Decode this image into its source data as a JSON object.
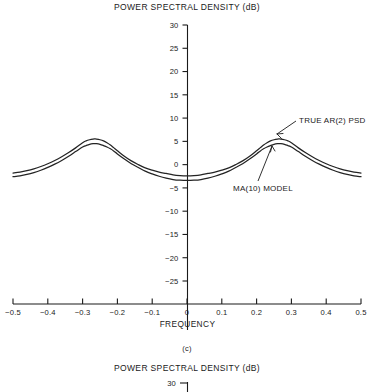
{
  "figure": {
    "panel_label": "(c)",
    "title": "POWER SPECTRAL DENSITY (dB)",
    "next_panel_title": "POWER SPECTRAL DENSITY (dB)",
    "next_panel_first_ytick": "30"
  },
  "chart_data": {
    "type": "line",
    "title": "POWER SPECTRAL DENSITY (dB)",
    "xlabel": "FREQUENCY",
    "ylabel": "POWER SPECTRAL DENSITY (dB)",
    "xlim": [
      -0.5,
      0.5
    ],
    "ylim": [
      -27.5,
      31
    ],
    "grid": false,
    "legend_position": "inline-annotations",
    "xticks": [
      -0.5,
      -0.4,
      -0.3,
      -0.2,
      -0.1,
      0,
      0.1,
      0.2,
      0.3,
      0.4,
      0.5
    ],
    "xticklabels": [
      "-0.5",
      "-0.4",
      "-0.3",
      "-0.2",
      "-0.1",
      "0",
      "0.1",
      "0.2",
      "0.3",
      "0.4",
      "0.5"
    ],
    "yticks": [
      30,
      25,
      20,
      15,
      10,
      5,
      0,
      -5,
      -10,
      -15,
      -20,
      -25
    ],
    "yticklabels": [
      "30",
      "25",
      "20",
      "15",
      "10",
      "5",
      "0",
      "-5",
      "-10",
      "-15",
      "-20",
      "-25"
    ],
    "annotations": [
      {
        "text": "TRUE AR(2) PSD",
        "points_to_series": "TRUE AR(2) PSD",
        "at_x": 0.245,
        "at_y": 5.4
      },
      {
        "text": "MA(10) MODEL",
        "points_to_series": "MA(10) MODEL",
        "at_x": 0.23,
        "at_y": 4.2
      }
    ],
    "x": [
      -0.5,
      -0.48,
      -0.46,
      -0.44,
      -0.42,
      -0.4,
      -0.38,
      -0.36,
      -0.34,
      -0.32,
      -0.3,
      -0.29,
      -0.28,
      -0.27,
      -0.265,
      -0.26,
      -0.25,
      -0.24,
      -0.23,
      -0.22,
      -0.21,
      -0.2,
      -0.18,
      -0.16,
      -0.14,
      -0.12,
      -0.1,
      -0.08,
      -0.06,
      -0.04,
      -0.02,
      0.0,
      0.02,
      0.04,
      0.06,
      0.08,
      0.1,
      0.12,
      0.14,
      0.16,
      0.18,
      0.2,
      0.21,
      0.22,
      0.23,
      0.24,
      0.25,
      0.26,
      0.265,
      0.27,
      0.28,
      0.29,
      0.3,
      0.32,
      0.34,
      0.36,
      0.38,
      0.4,
      0.42,
      0.44,
      0.46,
      0.48,
      0.5
    ],
    "series": [
      {
        "name": "TRUE AR(2) PSD",
        "values": [
          -1.8,
          -1.6,
          -1.3,
          -0.9,
          -0.4,
          0.2,
          0.9,
          1.7,
          2.6,
          3.6,
          4.7,
          5.1,
          5.35,
          5.5,
          5.52,
          5.5,
          5.35,
          5.1,
          4.7,
          4.2,
          3.6,
          3.0,
          1.8,
          0.8,
          0.0,
          -0.7,
          -1.2,
          -1.6,
          -1.9,
          -2.2,
          -2.35,
          -2.4,
          -2.35,
          -2.2,
          -1.9,
          -1.6,
          -1.2,
          -0.7,
          0.0,
          0.8,
          1.8,
          3.0,
          3.6,
          4.2,
          4.7,
          5.1,
          5.35,
          5.5,
          5.52,
          5.5,
          5.35,
          5.1,
          4.7,
          3.6,
          2.6,
          1.7,
          0.9,
          0.2,
          -0.4,
          -0.9,
          -1.3,
          -1.6,
          -1.8
        ]
      },
      {
        "name": "MA(10) MODEL",
        "values": [
          -2.6,
          -2.4,
          -2.1,
          -1.7,
          -1.2,
          -0.6,
          0.1,
          0.9,
          1.8,
          2.8,
          3.8,
          4.1,
          4.35,
          4.5,
          4.52,
          4.5,
          4.35,
          4.1,
          3.8,
          3.4,
          2.9,
          2.3,
          1.2,
          0.2,
          -0.6,
          -1.4,
          -2.0,
          -2.5,
          -2.9,
          -3.2,
          -3.35,
          -3.4,
          -3.35,
          -3.2,
          -2.9,
          -2.5,
          -2.0,
          -1.4,
          -0.6,
          0.2,
          1.2,
          2.3,
          2.9,
          3.4,
          3.8,
          4.1,
          4.35,
          4.5,
          4.52,
          4.5,
          4.35,
          4.1,
          3.8,
          2.8,
          1.8,
          0.9,
          0.1,
          -0.6,
          -1.2,
          -1.7,
          -2.1,
          -2.4,
          -2.6
        ]
      }
    ]
  }
}
